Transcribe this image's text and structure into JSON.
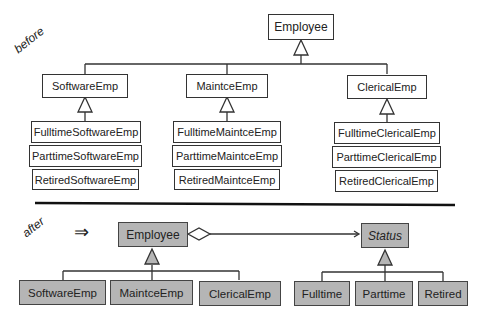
{
  "before": {
    "label": "before",
    "root": "Employee",
    "groups": [
      {
        "parent": "SoftwareEmp",
        "children": [
          "FulltimeSoftwareEmp",
          "PartimeSoftwareEmp_placeholder",
          "RetiredSoftwareEmp"
        ]
      },
      {
        "parent": "MaintceEmp",
        "children": [
          "FulltimeMaintceEmp",
          "ParttimeMaintceEmp",
          "RetiredMaintceEmp"
        ]
      },
      {
        "parent": "ClericalEmp",
        "children": [
          "FulltimeClericalEmp",
          "ParttimeClericalEmp",
          "RetiredClericalEmp"
        ]
      }
    ]
  },
  "after": {
    "label": "after",
    "arrow": "⇒",
    "root": "Employee",
    "status": "Status",
    "emp_children": [
      "SoftwareEmp",
      "MaintceEmp",
      "ClericalEmp"
    ],
    "status_children": [
      "Fulltime",
      "Parttime",
      "Retired"
    ]
  }
}
